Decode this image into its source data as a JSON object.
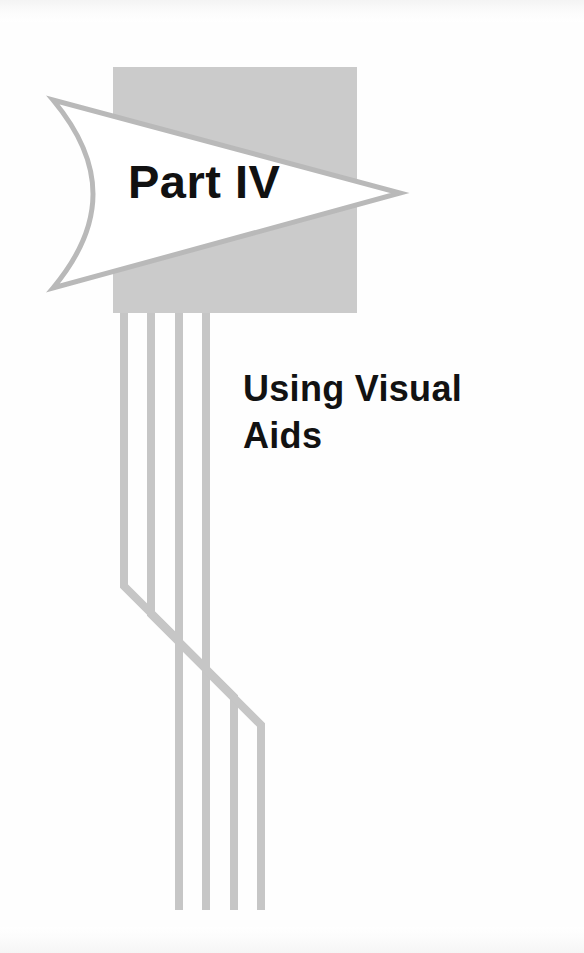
{
  "page": {
    "kind": "book-part-divider",
    "width": 584,
    "height": 953,
    "background_color": "#ffffff"
  },
  "part_banner": {
    "label": "Part IV",
    "shape": "pennant-flag-with-concave-left-edge-and-pointed-right-tip",
    "fill_color": "#ffffff",
    "stroke_color": "#b9b9b9",
    "text_color": "#111111"
  },
  "backdrop_square": {
    "name": "gray-square",
    "fill_color": "#cbcbcb",
    "x": 113,
    "y": 67,
    "width": 244,
    "height": 246
  },
  "part_title": {
    "lines": [
      "Using Visual",
      "Aids"
    ],
    "line1": "Using Visual",
    "line2": "Aids",
    "text_color": "#121212"
  },
  "ribbon_lines": {
    "name": "ribbon-cable-traces",
    "count": 4,
    "stroke_color": "#c6c6c6",
    "stroke_width": 8,
    "top_y": 313,
    "bottom_y": 910,
    "traces": [
      {
        "start_x": 124,
        "end_x": 179,
        "jog_start_y": 586,
        "jog_end_y": 641
      },
      {
        "start_x": 151,
        "end_x": 206,
        "jog_start_y": 614,
        "jog_end_y": 669
      },
      {
        "start_x": 179,
        "end_x": 234,
        "jog_start_y": 642,
        "jog_end_y": 697
      },
      {
        "start_x": 206,
        "end_x": 261,
        "jog_start_y": 670,
        "jog_end_y": 725
      }
    ]
  }
}
